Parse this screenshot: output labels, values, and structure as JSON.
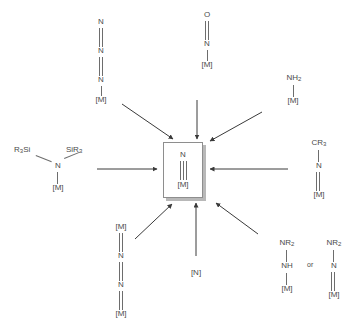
{
  "figure": {
    "type": "reaction-scheme",
    "center_label": "terminal metal nitride",
    "arrow_count": 8,
    "arrow_direction": "inward",
    "colors": {
      "line": "#6d6d6d",
      "text": "#4a4a4a",
      "box_border": "#8e8e8e",
      "box_shadow": "#b8b8b8",
      "background": "#ffffff"
    }
  },
  "product": {
    "name": "metal-nitride",
    "atoms": [
      "N",
      "[M]"
    ],
    "bond": "triple",
    "formula": "N≡[M]"
  },
  "precursors": [
    {
      "id": "azide-terminal",
      "position": "top-left",
      "formula": "N=N=N–[M]",
      "labels": [
        "N",
        "N",
        "N",
        "[M]"
      ],
      "bonds": [
        "double",
        "double",
        "single"
      ]
    },
    {
      "id": "nitrosyl",
      "position": "top-center",
      "formula": "O=N–[M]",
      "labels": [
        "O",
        "N",
        "[M]"
      ],
      "bonds": [
        "double",
        "single"
      ]
    },
    {
      "id": "amide",
      "position": "top-right",
      "formula": "NH2–[M]",
      "labels": [
        "NH",
        "[M]"
      ],
      "label_sub": "2",
      "bonds": [
        "single"
      ]
    },
    {
      "id": "bis-silyl-amide",
      "position": "left",
      "formula": "(R3Si)(SiR3)N–[M]",
      "labels": [
        "R",
        "Si",
        "SiR",
        "N",
        "[M]"
      ],
      "left_group": "R₃Si",
      "right_group": "SiR₃",
      "center_atom": "N",
      "metal": "[M]",
      "bonds": [
        "single",
        "single",
        "single"
      ]
    },
    {
      "id": "imide",
      "position": "right",
      "formula": "CR3–N=[M]",
      "labels": [
        "CR",
        "N",
        "[M]"
      ],
      "label_sub": "3",
      "bonds": [
        "single",
        "double"
      ]
    },
    {
      "id": "bridging-dinitrogen",
      "position": "bottom-left",
      "formula": "[M]=N=N=[M]",
      "labels": [
        "[M]",
        "N",
        "N",
        "[M]"
      ],
      "bonds": [
        "double",
        "double",
        "double"
      ]
    },
    {
      "id": "nitrogen-atom",
      "position": "bottom-center",
      "formula": "[N]",
      "labels": [
        "[N]"
      ],
      "bonds": []
    },
    {
      "id": "hydrazide",
      "position": "bottom-right",
      "formula": "NR2–NH–[M]",
      "labels": [
        "NR",
        "NH",
        "[M]"
      ],
      "label_sub": "2",
      "bonds": [
        "single",
        "single"
      ],
      "separator": "or",
      "alternative": {
        "id": "hydrazide-imido",
        "formula": "NR2–N=[M]",
        "labels": [
          "NR",
          "N",
          "[M]"
        ],
        "label_sub": "2",
        "bonds": [
          "single",
          "double"
        ]
      }
    }
  ],
  "text": {
    "N": "N",
    "O": "O",
    "M": "[M]",
    "N_bracket": "[N]",
    "NH": "NH",
    "NR": "NR",
    "CR": "CR",
    "R3Si": "R",
    "Si": "Si",
    "SiR": "SiR",
    "sub2": "2",
    "sub3": "3",
    "or": "or"
  }
}
